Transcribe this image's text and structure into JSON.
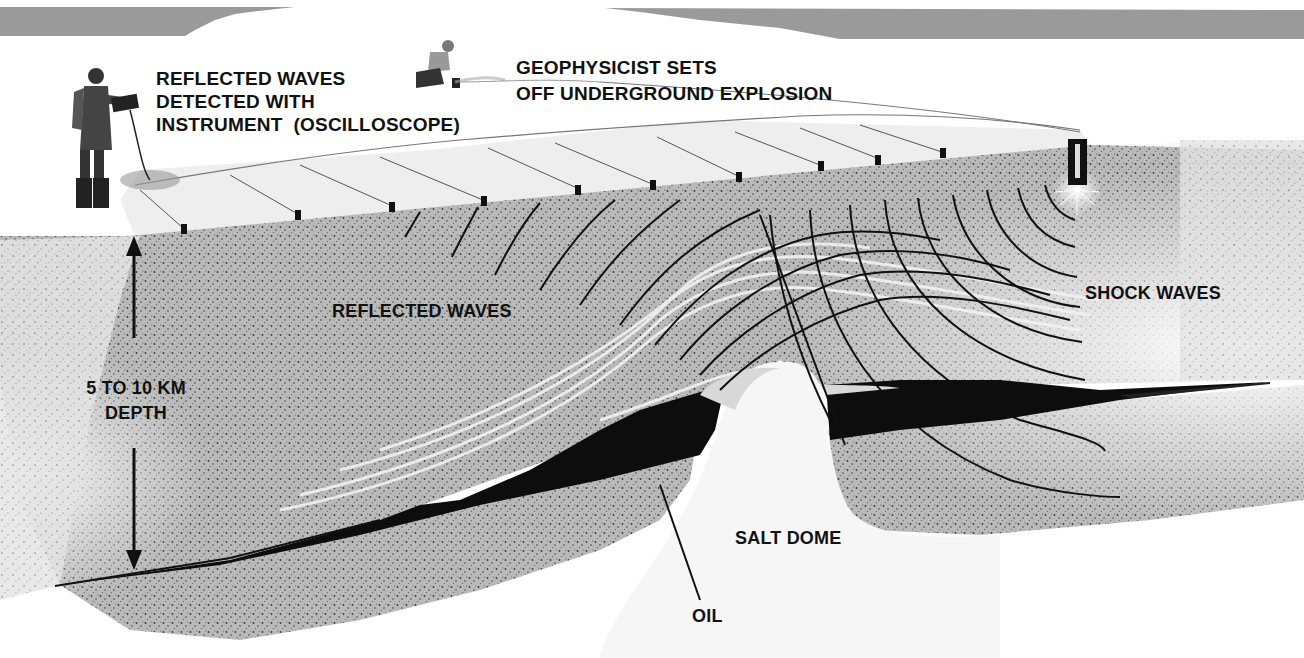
{
  "figure": {
    "type": "seismic-reflection-survey-illustration",
    "colors": {
      "banner_gray": "#9a9a9a",
      "surface": "#eeeeee",
      "rock_stipple": "#8c8c8c",
      "oil": "#0d0d0d",
      "salt_dome": "#f6f6f6",
      "wave_lines": "#111111",
      "text": "#111111"
    }
  },
  "labels": {
    "detector": {
      "lines": [
        "REFLECTED WAVES",
        "DETECTED WITH",
        "INSTRUMENT  (OSCILLOSCOPE)"
      ]
    },
    "geophysicist": {
      "lines": [
        "GEOPHYSICIST SETS",
        "OFF UNDERGROUND EXPLOSION"
      ]
    },
    "reflected_waves": "REFLECTED WAVES",
    "shock_waves": "SHOCK WAVES",
    "depth": {
      "lines": [
        "5 TO 10 KM",
        "DEPTH"
      ]
    },
    "salt_dome": "SALT DOME",
    "oil": "OIL"
  },
  "elements": {
    "people": [
      "person-with-oscilloscope",
      "crouching-geophysicist"
    ],
    "geophone_count": 12,
    "explosion_marker": "dynamite-charge",
    "depth_arrow": "double-headed-vertical-arrow"
  }
}
